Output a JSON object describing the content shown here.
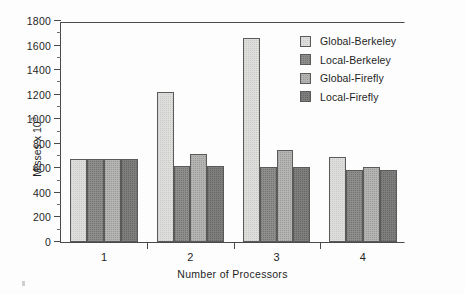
{
  "chart_data": {
    "type": "bar",
    "title": "",
    "xlabel": "Number of Processors",
    "ylabel": "Misses x 10^3",
    "ylabel_base": "Misses x 10",
    "ylabel_exp": "3",
    "categories": [
      "1",
      "2",
      "3",
      "4"
    ],
    "ylim": [
      0,
      1800
    ],
    "yticks": [
      0,
      200,
      400,
      600,
      800,
      1000,
      1200,
      1400,
      1600,
      1800
    ],
    "ytick_labels": [
      "0",
      "200",
      "400",
      "600",
      "800",
      "1000",
      "1200",
      "1400",
      "1600",
      "1800"
    ],
    "minor_tick_interval": 100,
    "grid": false,
    "legend_position": "top-right",
    "series": [
      {
        "name": "Global-Berkeley",
        "color": "#dededc",
        "values": [
          680,
          1220,
          1660,
          690
        ]
      },
      {
        "name": "Local-Berkeley",
        "color": "#8d8d8c",
        "values": [
          680,
          620,
          610,
          590
        ]
      },
      {
        "name": "Global-Firefly",
        "color": "#b4b4b2",
        "values": [
          680,
          715,
          752,
          615
        ]
      },
      {
        "name": "Local-Firefly",
        "color": "#7e7e7d",
        "values": [
          680,
          620,
          615,
          588
        ]
      }
    ]
  },
  "legend": {
    "items": [
      {
        "label": "Global-Berkeley"
      },
      {
        "label": "Local-Berkeley"
      },
      {
        "label": "Global-Firefly"
      },
      {
        "label": "Local-Firefly"
      }
    ]
  }
}
